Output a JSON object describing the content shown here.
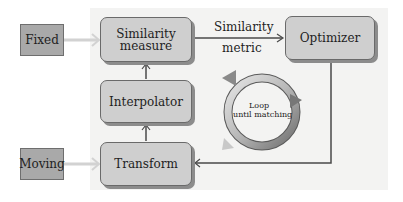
{
  "diagram": {
    "inputs": {
      "fixed": "Fixed",
      "moving": "Moving"
    },
    "blocks": {
      "similarity_measure": "Similarity measure",
      "similarity_measure_line1": "Similarity",
      "similarity_measure_line2": "measure",
      "interpolator": "Interpolator",
      "transform": "Transform",
      "optimizer": "Optimizer"
    },
    "edge_labels": {
      "similarity_metric_line1": "Similarity",
      "similarity_metric_line2": "metric"
    },
    "loop": {
      "line1": "Loop",
      "line2": "until matching"
    },
    "colors": {
      "panel": "#f3f3f2",
      "process_box": "#cfcfcf",
      "input_box": "#a9a9a9",
      "arrow_dark": "#4a4a4a",
      "arrow_light": "#cfcfcf"
    }
  }
}
